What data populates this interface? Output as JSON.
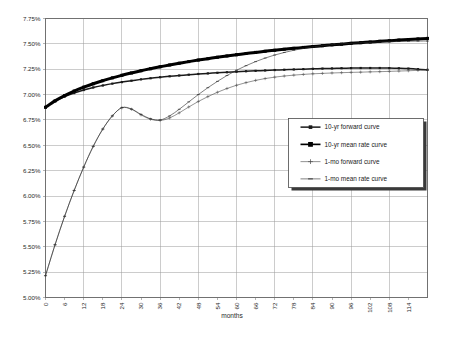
{
  "chart_data": {
    "type": "line",
    "title": "",
    "xlabel": "months",
    "ylabel": "",
    "grid": true,
    "legend_position": "inside-lower-right",
    "xlim": [
      0,
      120
    ],
    "ylim": [
      5.0,
      7.75
    ],
    "y_tick_labels": [
      "5.00%",
      "5.25%",
      "5.50%",
      "5.75%",
      "6.00%",
      "6.25%",
      "6.50%",
      "6.75%",
      "7.00%",
      "7.25%",
      "7.50%",
      "7.75%"
    ],
    "y_tick_values": [
      5.0,
      5.25,
      5.5,
      5.75,
      6.0,
      6.25,
      6.5,
      6.75,
      7.0,
      7.25,
      7.5,
      7.75
    ],
    "x_tick_labels": [
      "0",
      "6",
      "12",
      "18",
      "24",
      "30",
      "36",
      "42",
      "48",
      "54",
      "60",
      "66",
      "72",
      "78",
      "84",
      "90",
      "96",
      "102",
      "108",
      "114"
    ],
    "x_tick_values": [
      0,
      6,
      12,
      18,
      24,
      30,
      36,
      42,
      48,
      54,
      60,
      66,
      72,
      78,
      84,
      90,
      96,
      102,
      108,
      114
    ],
    "x": [
      0,
      3,
      6,
      9,
      12,
      15,
      18,
      21,
      24,
      27,
      30,
      33,
      36,
      39,
      42,
      45,
      48,
      51,
      54,
      57,
      60,
      63,
      66,
      69,
      72,
      75,
      78,
      81,
      84,
      87,
      90,
      93,
      96,
      99,
      102,
      105,
      108,
      111,
      114,
      117,
      120
    ],
    "series": [
      {
        "name": "10-yr forward curve",
        "marker": "small-square",
        "line_weight": "medium",
        "color": "#1a1a1a",
        "values": [
          6.875,
          6.935,
          6.98,
          7.015,
          7.045,
          7.07,
          7.09,
          7.108,
          7.123,
          7.137,
          7.15,
          7.161,
          7.171,
          7.18,
          7.188,
          7.196,
          7.203,
          7.209,
          7.215,
          7.22,
          7.225,
          7.23,
          7.234,
          7.238,
          7.242,
          7.245,
          7.248,
          7.251,
          7.254,
          7.256,
          7.258,
          7.26,
          7.261,
          7.262,
          7.262,
          7.262,
          7.261,
          7.259,
          7.256,
          7.251,
          7.244
        ]
      },
      {
        "name": "10-yr mean rate curve",
        "marker": "filled-square",
        "line_weight": "thick",
        "color": "#000000",
        "values": [
          6.875,
          6.938,
          6.99,
          7.035,
          7.073,
          7.107,
          7.137,
          7.165,
          7.19,
          7.213,
          7.235,
          7.255,
          7.274,
          7.292,
          7.309,
          7.325,
          7.34,
          7.354,
          7.368,
          7.381,
          7.393,
          7.405,
          7.416,
          7.427,
          7.437,
          7.447,
          7.456,
          7.465,
          7.474,
          7.482,
          7.49,
          7.497,
          7.505,
          7.512,
          7.518,
          7.525,
          7.531,
          7.537,
          7.543,
          7.549,
          7.554
        ]
      },
      {
        "name": "1-mo forward curve",
        "marker": "plus",
        "line_weight": "thin",
        "color": "#4a4a4a",
        "values": [
          5.215,
          5.52,
          5.8,
          6.055,
          6.285,
          6.49,
          6.66,
          6.79,
          6.87,
          6.855,
          6.8,
          6.757,
          6.745,
          6.77,
          6.82,
          6.878,
          6.932,
          6.98,
          7.023,
          7.06,
          7.092,
          7.118,
          7.14,
          7.158,
          7.172,
          7.183,
          7.192,
          7.199,
          7.205,
          7.209,
          7.213,
          7.216,
          7.219,
          7.221,
          7.224,
          7.226,
          7.229,
          7.232,
          7.235,
          7.239,
          7.243
        ]
      },
      {
        "name": "1-mo mean rate curve",
        "marker": "dash",
        "line_weight": "thin",
        "color": "#2a2a2a",
        "values": [
          5.215,
          5.52,
          5.8,
          6.055,
          6.285,
          6.49,
          6.66,
          6.79,
          6.872,
          6.858,
          6.805,
          6.762,
          6.75,
          6.79,
          6.855,
          6.928,
          7.0,
          7.068,
          7.13,
          7.188,
          7.24,
          7.285,
          7.325,
          7.36,
          7.39,
          7.415,
          7.437,
          7.455,
          7.47,
          7.482,
          7.492,
          7.5,
          7.506,
          7.511,
          7.515,
          7.518,
          7.521,
          7.523,
          7.525,
          7.527,
          7.528
        ]
      }
    ]
  },
  "legend": {
    "entries": [
      {
        "label": "10-yr forward curve"
      },
      {
        "label": "10-yr mean rate curve"
      },
      {
        "label": "1-mo forward curve"
      },
      {
        "label": "1-mo mean rate curve"
      }
    ]
  }
}
